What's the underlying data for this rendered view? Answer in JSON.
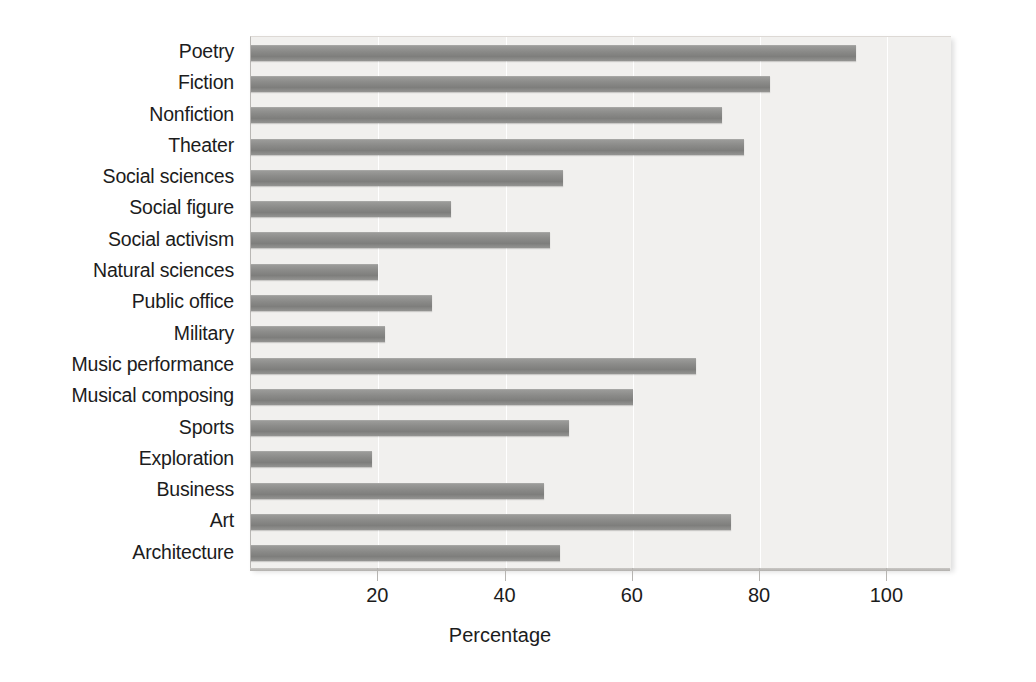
{
  "chart_data": {
    "type": "bar",
    "orientation": "horizontal",
    "title": "",
    "xlabel": "Percentage",
    "ylabel": "",
    "xlim": [
      0,
      110
    ],
    "ylim": null,
    "grid": true,
    "legend": false,
    "xticks": [
      20,
      40,
      60,
      80,
      100
    ],
    "xtick_labels": [
      "20",
      "40",
      "60",
      "80",
      "100"
    ],
    "categories": [
      "Poetry",
      "Fiction",
      "Nonfiction",
      "Theater",
      "Social sciences",
      "Social figure",
      "Social activism",
      "Natural sciences",
      "Public office",
      "Military",
      "Music performance",
      "Musical composing",
      "Sports",
      "Exploration",
      "Business",
      "Art",
      "Architecture"
    ],
    "values": [
      95,
      81.5,
      74,
      77.5,
      49,
      31.5,
      47,
      20,
      28.5,
      21,
      70,
      60,
      50,
      19,
      46,
      75.5,
      48.5
    ],
    "bar_color": "#8b8b89",
    "plot_background": "#f1f0ee",
    "page_background": "#ffffff"
  }
}
